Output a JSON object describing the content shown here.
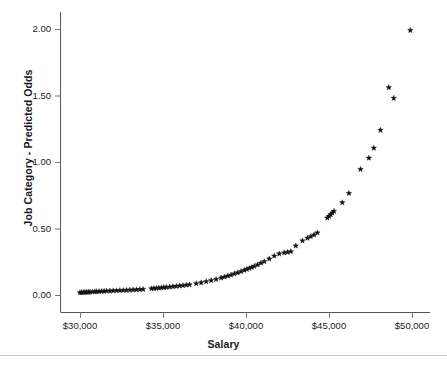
{
  "chart_data": {
    "type": "scatter",
    "title": "",
    "xlabel": "Salary",
    "ylabel": "Job Category - Predicted Odds",
    "xlim": [
      29200,
      50600
    ],
    "ylim": [
      -0.05,
      2.12
    ],
    "xticks": [
      30000,
      35000,
      40000,
      45000,
      50000
    ],
    "xticklabels": [
      "$30,000",
      "$35,000",
      "$40,000",
      "$45,000",
      "$50,000"
    ],
    "yticks": [
      0.0,
      0.5,
      1.0,
      1.5,
      2.0
    ],
    "yticklabels": [
      "0.00",
      "0.50",
      "1.00",
      "1.50",
      "2.00"
    ],
    "grid": false,
    "legend": null,
    "marker": "star",
    "marker_color": "#111111",
    "series": [
      {
        "name": "Predicted Odds",
        "x": [
          30000,
          30100,
          30200,
          30300,
          30400,
          30500,
          30600,
          30750,
          30900,
          31000,
          31150,
          31300,
          31450,
          31600,
          31800,
          32000,
          32200,
          32400,
          32600,
          32800,
          33000,
          33200,
          33400,
          33600,
          33800,
          34300,
          34450,
          34600,
          34750,
          34900,
          35050,
          35200,
          35400,
          35600,
          35800,
          36000,
          36200,
          36400,
          36600,
          37000,
          37300,
          37600,
          37900,
          38200,
          38500,
          38700,
          38900,
          39100,
          39300,
          39500,
          39700,
          39900,
          40050,
          40200,
          40350,
          40500,
          40700,
          40900,
          41100,
          41400,
          41700,
          42000,
          42300,
          42500,
          42700,
          43000,
          43400,
          43700,
          43900,
          44100,
          44300,
          44900,
          45000,
          45100,
          45200,
          45300,
          45800,
          46200,
          46900,
          47400,
          47700,
          48100,
          48600,
          48900,
          49900
        ],
        "y": [
          0.018,
          0.019,
          0.02,
          0.021,
          0.021,
          0.022,
          0.023,
          0.024,
          0.025,
          0.026,
          0.027,
          0.028,
          0.029,
          0.03,
          0.031,
          0.032,
          0.033,
          0.034,
          0.035,
          0.036,
          0.038,
          0.039,
          0.04,
          0.042,
          0.043,
          0.048,
          0.05,
          0.051,
          0.053,
          0.055,
          0.057,
          0.059,
          0.061,
          0.063,
          0.066,
          0.069,
          0.072,
          0.075,
          0.078,
          0.086,
          0.093,
          0.101,
          0.109,
          0.118,
          0.129,
          0.136,
          0.143,
          0.151,
          0.16,
          0.168,
          0.177,
          0.187,
          0.194,
          0.201,
          0.208,
          0.216,
          0.228,
          0.24,
          0.252,
          0.272,
          0.294,
          0.31,
          0.318,
          0.322,
          0.327,
          0.37,
          0.408,
          0.428,
          0.44,
          0.452,
          0.468,
          0.58,
          0.592,
          0.605,
          0.618,
          0.63,
          0.695,
          0.765,
          0.945,
          1.03,
          1.105,
          1.24,
          1.56,
          1.48,
          1.99
        ]
      }
    ]
  },
  "figure": {
    "axis_line_color": "#555555",
    "tick_color": "#777777",
    "divider_color": "#c9c9c9",
    "background": "#ffffff"
  }
}
